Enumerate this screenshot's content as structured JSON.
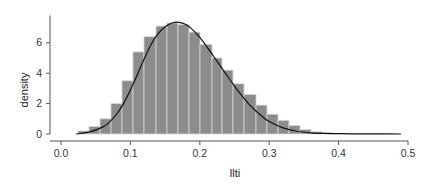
{
  "chart_data": {
    "type": "bar",
    "subtype": "histogram-with-density-curve",
    "title": "",
    "xlabel": "llti",
    "ylabel": "density",
    "xlim": [
      -0.005,
      0.505
    ],
    "ylim": [
      0,
      7.8
    ],
    "x_ticks": [
      0.0,
      0.1,
      0.2,
      0.3,
      0.4,
      0.5
    ],
    "x_tick_labels": [
      "0.0",
      "0.1",
      "0.2",
      "0.3",
      "0.4",
      "0.5"
    ],
    "y_ticks": [
      0,
      2,
      4,
      6
    ],
    "y_tick_labels": [
      "0",
      "2",
      "4",
      "6"
    ],
    "grid": false,
    "legend": null,
    "bin_width": 0.016,
    "bins": [
      {
        "x0": 0.0245,
        "x1": 0.0403,
        "density": 0.2
      },
      {
        "x0": 0.0403,
        "x1": 0.0562,
        "density": 0.5
      },
      {
        "x0": 0.0562,
        "x1": 0.072,
        "density": 1.0
      },
      {
        "x0": 0.072,
        "x1": 0.0879,
        "density": 2.0
      },
      {
        "x0": 0.0879,
        "x1": 0.1037,
        "density": 3.5
      },
      {
        "x0": 0.1037,
        "x1": 0.1196,
        "density": 5.4
      },
      {
        "x0": 0.1196,
        "x1": 0.1369,
        "density": 6.4
      },
      {
        "x0": 0.1369,
        "x1": 0.1527,
        "density": 7.1
      },
      {
        "x0": 0.1527,
        "x1": 0.1686,
        "density": 7.3
      },
      {
        "x0": 0.1686,
        "x1": 0.1844,
        "density": 7.2
      },
      {
        "x0": 0.1844,
        "x1": 0.2003,
        "density": 6.7
      },
      {
        "x0": 0.2003,
        "x1": 0.2176,
        "density": 5.9
      },
      {
        "x0": 0.2176,
        "x1": 0.232,
        "density": 5.0
      },
      {
        "x0": 0.232,
        "x1": 0.2478,
        "density": 4.2
      },
      {
        "x0": 0.2478,
        "x1": 0.2637,
        "density": 3.3
      },
      {
        "x0": 0.2637,
        "x1": 0.281,
        "density": 2.6
      },
      {
        "x0": 0.281,
        "x1": 0.2968,
        "density": 1.9
      },
      {
        "x0": 0.2968,
        "x1": 0.3127,
        "density": 1.3
      },
      {
        "x0": 0.3127,
        "x1": 0.3285,
        "density": 0.9
      },
      {
        "x0": 0.3285,
        "x1": 0.3444,
        "density": 0.55
      },
      {
        "x0": 0.3444,
        "x1": 0.3602,
        "density": 0.3
      },
      {
        "x0": 0.3602,
        "x1": 0.3761,
        "density": 0.15
      },
      {
        "x0": 0.3761,
        "x1": 0.3919,
        "density": 0.08
      }
    ],
    "density_curve": {
      "x": [
        0.022,
        0.04,
        0.06,
        0.07,
        0.08,
        0.09,
        0.1,
        0.11,
        0.12,
        0.13,
        0.14,
        0.15,
        0.16,
        0.17,
        0.18,
        0.19,
        0.2,
        0.21,
        0.22,
        0.23,
        0.24,
        0.25,
        0.26,
        0.27,
        0.28,
        0.29,
        0.3,
        0.32,
        0.34,
        0.36,
        0.38,
        0.4,
        0.43,
        0.46,
        0.49
      ],
      "y": [
        0.0,
        0.12,
        0.45,
        0.8,
        1.3,
        2.0,
        2.9,
        3.9,
        4.95,
        5.9,
        6.6,
        7.05,
        7.3,
        7.35,
        7.2,
        6.85,
        6.35,
        5.75,
        5.1,
        4.45,
        3.8,
        3.15,
        2.55,
        2.0,
        1.55,
        1.15,
        0.82,
        0.4,
        0.18,
        0.08,
        0.04,
        0.02,
        0.01,
        0.005,
        0.0
      ]
    },
    "colors": {
      "bar_fill": "#8c8c8c",
      "bar_edge": "#d6d6d6",
      "curve": "#111111",
      "axis": "#555555"
    }
  }
}
